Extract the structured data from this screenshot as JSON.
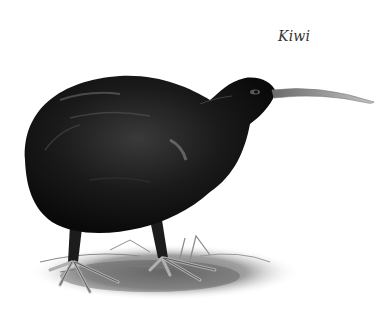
{
  "caption": {
    "text": "Kiwi"
  },
  "illustration": {
    "subject": "kiwi-bird",
    "style": "grayscale ink/pencil illustration",
    "colors": {
      "body": "#141414",
      "body_highlight": "#5a5a5a",
      "beak": "#b8b8b8",
      "ground": "#8c8c8c",
      "feet": "#c8c8c8",
      "background": "#ffffff"
    }
  }
}
